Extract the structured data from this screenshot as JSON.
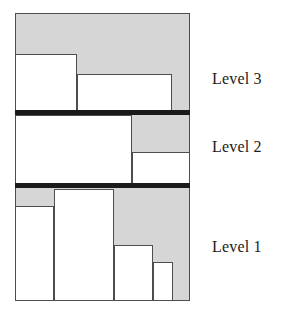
{
  "figure": {
    "colors": {
      "panel_fill": "#d6d6d6",
      "item_fill": "#ffffff",
      "stroke": "#4d4d4d",
      "separator": "#1a1a1a",
      "label_text": "#1c1c1c"
    },
    "panel": {
      "x": 15,
      "y": 13,
      "width": 175,
      "height": 288
    },
    "labels": [
      {
        "name": "level-3-label",
        "text": "Level 3",
        "x": 212,
        "y": 70
      },
      {
        "name": "level-2-label",
        "text": "Level 2",
        "x": 212,
        "y": 138
      },
      {
        "name": "level-1-label",
        "text": "Level 1",
        "x": 212,
        "y": 238
      }
    ],
    "separators": [
      {
        "name": "separator-level3-level2",
        "x": 15,
        "y": 110,
        "width": 175,
        "height": 5
      },
      {
        "name": "separator-level2-level1",
        "x": 15,
        "y": 183,
        "width": 175,
        "height": 5
      }
    ],
    "levels": [
      {
        "name": "level-3",
        "label": "Level 3",
        "items": [
          {
            "name": "item-l3-1",
            "x": 15,
            "y": 54,
            "width": 62,
            "height": 57
          },
          {
            "name": "item-l3-2",
            "x": 77,
            "y": 74,
            "width": 95,
            "height": 37
          }
        ]
      },
      {
        "name": "level-2",
        "label": "Level 2",
        "items": [
          {
            "name": "item-l2-1",
            "x": 15,
            "y": 115,
            "width": 117,
            "height": 69
          },
          {
            "name": "item-l2-2",
            "x": 132,
            "y": 152,
            "width": 58,
            "height": 32
          }
        ]
      },
      {
        "name": "level-1",
        "label": "Level 1",
        "items": [
          {
            "name": "item-l1-1",
            "x": 15,
            "y": 206,
            "width": 39,
            "height": 95
          },
          {
            "name": "item-l1-2",
            "x": 54,
            "y": 189,
            "width": 60,
            "height": 112
          },
          {
            "name": "item-l1-3",
            "x": 114,
            "y": 245,
            "width": 39,
            "height": 56
          },
          {
            "name": "item-l1-4",
            "x": 153,
            "y": 262,
            "width": 20,
            "height": 39
          }
        ]
      }
    ]
  }
}
